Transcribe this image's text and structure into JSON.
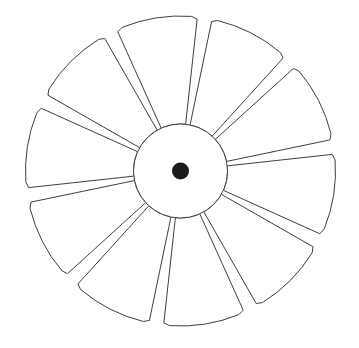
{
  "figure": {
    "kind": "line-drawing",
    "alt_text": "Outline drawing of a ten-petal flower shaped like a fan rotor, with a plain circular hub and a solid dark dot at the very centre",
    "background_color": "#ffffff",
    "stroke_color": "#3f3f3f",
    "stroke_width": 1,
    "fill_color": "#ffffff",
    "canvas": {
      "width": 359,
      "height": 348
    }
  },
  "geometry": {
    "center": {
      "x": 180.5,
      "y": 171.0
    },
    "hub": {
      "label": "center hub circle",
      "radius": 47,
      "fill": "#ffffff",
      "stroke": "#3f3f3f"
    },
    "hub_dot": {
      "label": "center dot",
      "radius": 8.5,
      "fill": "#1c1c1c"
    },
    "petals": {
      "count": 10,
      "inner_radius": 47,
      "outer_radius": 155,
      "angular_pitch_deg": 36,
      "petal_sweep_deg": 30.5,
      "gap_sweep_deg": 5.5,
      "start_angle_deg": -99,
      "outer_edge": "arc",
      "inner_edge": "point-toward-center",
      "tip_chamfer": 0.86
    }
  },
  "petal_list": [
    {
      "index": 1,
      "name": "petal-1",
      "center_angle_deg": -99,
      "position": "top"
    },
    {
      "index": 2,
      "name": "petal-2",
      "center_angle_deg": -63,
      "position": "upper-right"
    },
    {
      "index": 3,
      "name": "petal-3",
      "center_angle_deg": -27,
      "position": "right-upper"
    },
    {
      "index": 4,
      "name": "petal-4",
      "center_angle_deg": 9,
      "position": "right-lower"
    },
    {
      "index": 5,
      "name": "petal-5",
      "center_angle_deg": 45,
      "position": "lower-right"
    },
    {
      "index": 6,
      "name": "petal-6",
      "center_angle_deg": 81,
      "position": "bottom"
    },
    {
      "index": 7,
      "name": "petal-7",
      "center_angle_deg": 117,
      "position": "lower-left"
    },
    {
      "index": 8,
      "name": "petal-8",
      "center_angle_deg": 153,
      "position": "left-lower"
    },
    {
      "index": 9,
      "name": "petal-9",
      "center_angle_deg": 189,
      "position": "left-upper"
    },
    {
      "index": 10,
      "name": "petal-10",
      "center_angle_deg": 225,
      "position": "upper-left"
    }
  ]
}
